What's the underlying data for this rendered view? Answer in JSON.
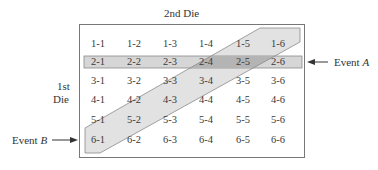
{
  "diagram": {
    "top_label": "2nd Die",
    "side_label_line1": "1st",
    "side_label_line2": "Die",
    "event_a": {
      "prefix": "Event ",
      "name": "A",
      "description": "Row where 1st die = 2"
    },
    "event_b": {
      "prefix": "Event ",
      "name": "B",
      "description": "Diagonal band of outcomes"
    },
    "colors": {
      "border": "#777777",
      "event_a_fill": "#d6d6d6",
      "event_b_fill": "#e2e2e2",
      "overlap_fill": "#b4b4b4",
      "text": "#333333"
    },
    "grid": [
      [
        "1-1",
        "1-2",
        "1-3",
        "1-4",
        "1-5",
        "1-6"
      ],
      [
        "2-1",
        "2-2",
        "2-3",
        "2-4",
        "2-5",
        "2-6"
      ],
      [
        "3-1",
        "3-2",
        "3-3",
        "3-4",
        "3-5",
        "3-6"
      ],
      [
        "4-1",
        "4-2",
        "4-3",
        "4-4",
        "4-5",
        "4-6"
      ],
      [
        "5-1",
        "5-2",
        "5-3",
        "5-4",
        "5-5",
        "5-6"
      ],
      [
        "6-1",
        "6-2",
        "6-3",
        "6-4",
        "6-5",
        "6-6"
      ]
    ]
  }
}
